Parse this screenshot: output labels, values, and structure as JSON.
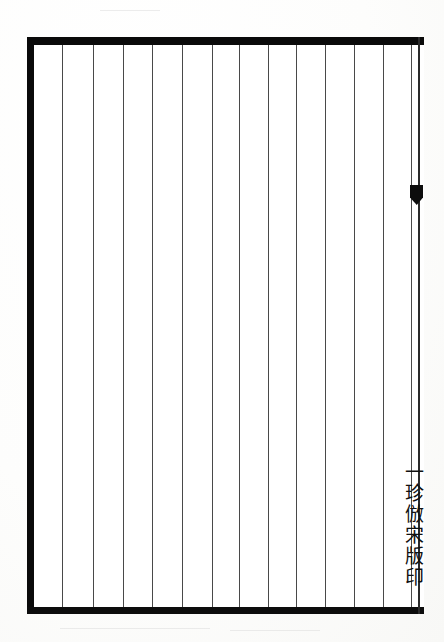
{
  "page": {
    "width": 444,
    "height": 642,
    "background_color": "#fefefe",
    "paper_color": "#ffffff"
  },
  "frame": {
    "name": "ruled-block-frame",
    "ink_color": "#0a0a0a",
    "rule_color": "#3a3a3a",
    "left_x": 27,
    "top_y": 37,
    "width": 397,
    "height": 577,
    "thick_border_px": 8,
    "thin_border_px": 2
  },
  "columns": {
    "count": 14,
    "line_color": "#3a3a3a",
    "x_positions": [
      62,
      93,
      123,
      152,
      182,
      212,
      239,
      268,
      296,
      325,
      354,
      383,
      411
    ]
  },
  "fishtail": {
    "name": "fishtail-center-mark",
    "x": 410,
    "y": 185,
    "width": 13,
    "height": 20,
    "color": "#0d0d0d"
  },
  "inscription": {
    "name": "vertical-inscription",
    "text": "一珍倣宋版印",
    "characters": [
      "一",
      "珍",
      "倣",
      "宋",
      "版",
      "印"
    ],
    "orientation": "vertical-rl",
    "x": 403,
    "y": 462,
    "font_size_px": 19,
    "color": "#111111"
  }
}
